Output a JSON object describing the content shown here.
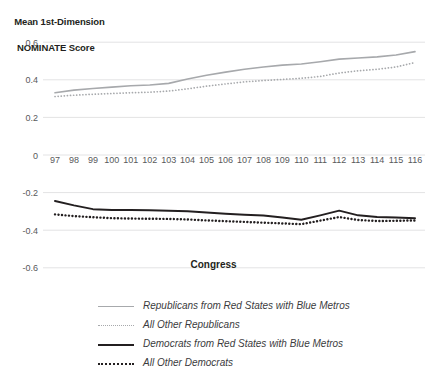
{
  "chart_data": {
    "type": "line",
    "title": "",
    "ylabel": "Mean 1st-Dimension NOMINATE Score",
    "ylabel_line1": "Mean 1st-Dimension",
    "ylabel_line2": "NOMINATE Score",
    "xlabel": "Congress",
    "categories": [
      "97",
      "98",
      "99",
      "100",
      "101",
      "102",
      "103",
      "104",
      "105",
      "106",
      "107",
      "108",
      "109",
      "110",
      "111",
      "112",
      "113",
      "114",
      "115",
      "116"
    ],
    "xtick_labels": [
      "97",
      "98",
      "99",
      "100",
      "101",
      "102",
      "103",
      "104",
      "105",
      "106",
      "107",
      "108",
      "109",
      "110",
      "111",
      "112",
      "113",
      "114",
      "115",
      "116"
    ],
    "ytick_labels": [
      "0.6",
      "0.4",
      "0.2",
      "0",
      "-0.2",
      "-0.4",
      "-0.6"
    ],
    "ytick_values": [
      0.6,
      0.4,
      0.2,
      0,
      -0.2,
      -0.4,
      -0.6
    ],
    "ylim": [
      -0.62,
      0.64
    ],
    "grid": true,
    "grid_axis": "y",
    "legend_position": "bottom",
    "series": [
      {
        "name": "Republicans from Red States with Blue Metros",
        "style": "solid",
        "color": "#a7a9ac",
        "values": [
          0.331,
          0.345,
          0.354,
          0.361,
          0.368,
          0.372,
          0.381,
          0.404,
          0.424,
          0.441,
          0.456,
          0.468,
          0.478,
          0.484,
          0.496,
          0.51,
          0.516,
          0.522,
          0.532,
          0.55
        ]
      },
      {
        "name": "All Other Republicans",
        "style": "dotted",
        "color": "#a7a9ac",
        "values": [
          0.311,
          0.318,
          0.323,
          0.327,
          0.331,
          0.334,
          0.34,
          0.352,
          0.366,
          0.378,
          0.389,
          0.396,
          0.402,
          0.408,
          0.418,
          0.436,
          0.448,
          0.456,
          0.468,
          0.492
        ]
      },
      {
        "name": "Democrats from Red States with Blue Metros",
        "style": "solid",
        "color": "#231f20",
        "values": [
          -0.245,
          -0.268,
          -0.288,
          -0.292,
          -0.293,
          -0.294,
          -0.296,
          -0.299,
          -0.306,
          -0.312,
          -0.318,
          -0.322,
          -0.332,
          -0.344,
          -0.321,
          -0.296,
          -0.321,
          -0.33,
          -0.333,
          -0.336
        ]
      },
      {
        "name": "All Other Democrats",
        "style": "dotted",
        "color": "#231f20",
        "values": [
          -0.316,
          -0.325,
          -0.331,
          -0.336,
          -0.338,
          -0.339,
          -0.34,
          -0.343,
          -0.348,
          -0.352,
          -0.356,
          -0.36,
          -0.364,
          -0.368,
          -0.349,
          -0.33,
          -0.346,
          -0.351,
          -0.35,
          -0.348
        ]
      }
    ]
  },
  "legend": {
    "items": [
      {
        "label": "Republicans from Red States with Blue Metros",
        "swatch": "sw-gray-solid"
      },
      {
        "label": "All Other Republicans",
        "swatch": "sw-gray-dot"
      },
      {
        "label": "Democrats from Red States with Blue Metros",
        "swatch": "sw-black-solid"
      },
      {
        "label": "All Other Democrats",
        "swatch": "sw-black-dot"
      }
    ]
  },
  "colors": {
    "republican_line": "#a7a9ac",
    "democrat_line": "#231f20",
    "gridline": "#e3e3e4",
    "tick_text": "#58595b",
    "background": "#ffffff"
  }
}
